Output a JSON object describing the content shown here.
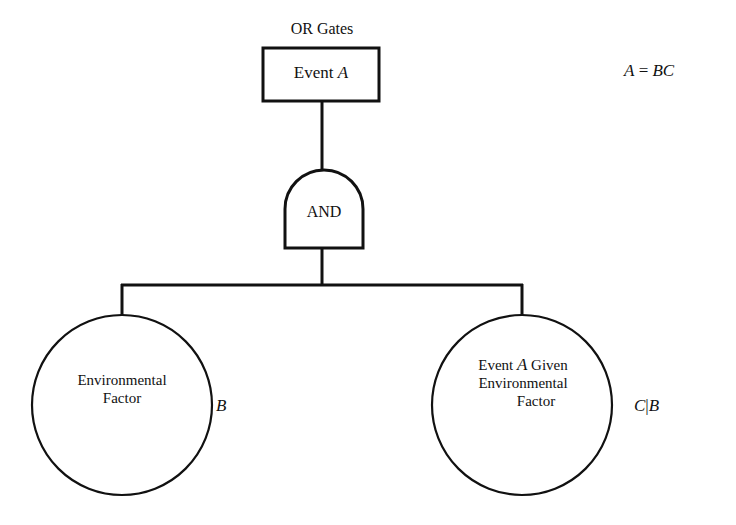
{
  "figure": {
    "type": "fault-tree-diagram",
    "background_color": "#ffffff",
    "ink_color": "#111111",
    "caption": "OR Gates"
  },
  "nodes": {
    "top_event": {
      "shape": "rectangle",
      "label": "Event A",
      "label_plain": "Event A",
      "italic_symbol": "A"
    },
    "gate": {
      "shape": "and-gate",
      "label": "AND"
    },
    "basic_event_left": {
      "shape": "circle",
      "line1": "Environmental",
      "line2": "Factor",
      "variable": "B"
    },
    "basic_event_right": {
      "shape": "circle",
      "line1": "Event A Given",
      "line2": "Environmental",
      "line3": "Factor",
      "variable": "C|B"
    }
  },
  "annotations": {
    "equation": "A = BC",
    "equation_lhs": "A",
    "equation_op": "=",
    "equation_rhs": "BC"
  },
  "edges": [
    {
      "from": "top_event",
      "to": "gate",
      "style": "vertical-line"
    },
    {
      "from": "gate",
      "to": "basic_event_left",
      "style": "orthogonal-branch"
    },
    {
      "from": "gate",
      "to": "basic_event_right",
      "style": "orthogonal-branch"
    }
  ],
  "geometry": {
    "box": {
      "x": 263,
      "y": 48,
      "w": 116,
      "h": 53
    },
    "gate": {
      "cx": 322,
      "top": 170,
      "bottom": 248,
      "left": 285,
      "right": 363
    },
    "bus_y": 285,
    "left_circle": {
      "cx": 122,
      "cy": 405,
      "r": 90
    },
    "right_circle": {
      "cx": 522,
      "cy": 405,
      "r": 90
    }
  }
}
